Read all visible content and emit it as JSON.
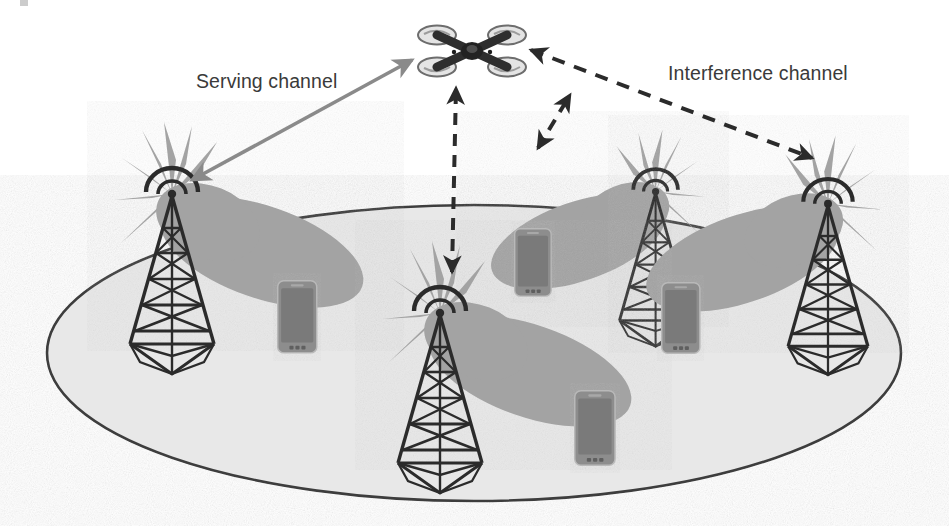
{
  "figure": {
    "background_color": "#ffffff"
  },
  "labels": {
    "serving": "Serving channel",
    "interference": "Interference channel"
  },
  "colors": {
    "ground_fill": "#e8e8e8",
    "ground_stroke": "#3d3d3d",
    "beam_lobe": "#a3a3a3",
    "tower_stroke": "#2b2b2b",
    "phone_body": "#8d8d8d",
    "phone_screen": "#7b7b7b",
    "phone_outline": "#b7b7b7",
    "solid_arrow": "#8a8a8a",
    "dashed_arrow": "#2b2b2b",
    "drone_body": "#2e2e2e",
    "drone_rotor": "#d0d0d0",
    "text": "#3a3a3a"
  },
  "drone": {
    "name": "quadcopter-uav",
    "x": 470,
    "y": 48,
    "rotors": 4
  },
  "ground_ellipse": {
    "cx": 474,
    "cy": 353,
    "rx": 427,
    "ry": 148
  },
  "towers": [
    {
      "id": "tower-left",
      "x": 172,
      "y": 218,
      "scale": 1.0,
      "lobe_direction": "right"
    },
    {
      "id": "tower-center",
      "x": 440,
      "y": 325,
      "scale": 1.0,
      "lobe_direction": "right"
    },
    {
      "id": "tower-upper-middle",
      "x": 604,
      "y": 190,
      "scale": 0.86,
      "lobe_direction": "left"
    },
    {
      "id": "tower-right",
      "x": 827,
      "y": 212,
      "scale": 0.95,
      "lobe_direction": "left"
    }
  ],
  "phones": [
    {
      "id": "phone-1",
      "x": 299,
      "y": 318
    },
    {
      "id": "phone-2",
      "x": 534,
      "y": 259
    },
    {
      "id": "phone-3",
      "x": 682,
      "y": 316
    },
    {
      "id": "phone-4",
      "x": 597,
      "y": 427
    }
  ],
  "channels": [
    {
      "id": "serving-channel",
      "style": "solid",
      "arrowheads": "double",
      "from": "tower-left",
      "to": "drone",
      "label": "Serving channel"
    },
    {
      "id": "interference-center",
      "style": "dashed",
      "arrowheads": "double",
      "from": "tower-center",
      "to": "drone",
      "label": "Interference channel"
    },
    {
      "id": "interference-middle",
      "style": "dashed",
      "arrowheads": "double",
      "from": "tower-upper-middle",
      "to": "drone",
      "label": "Interference channel"
    },
    {
      "id": "interference-right",
      "style": "dashed",
      "arrowheads": "double",
      "from": "tower-right",
      "to": "drone",
      "label": "Interference channel"
    }
  ]
}
